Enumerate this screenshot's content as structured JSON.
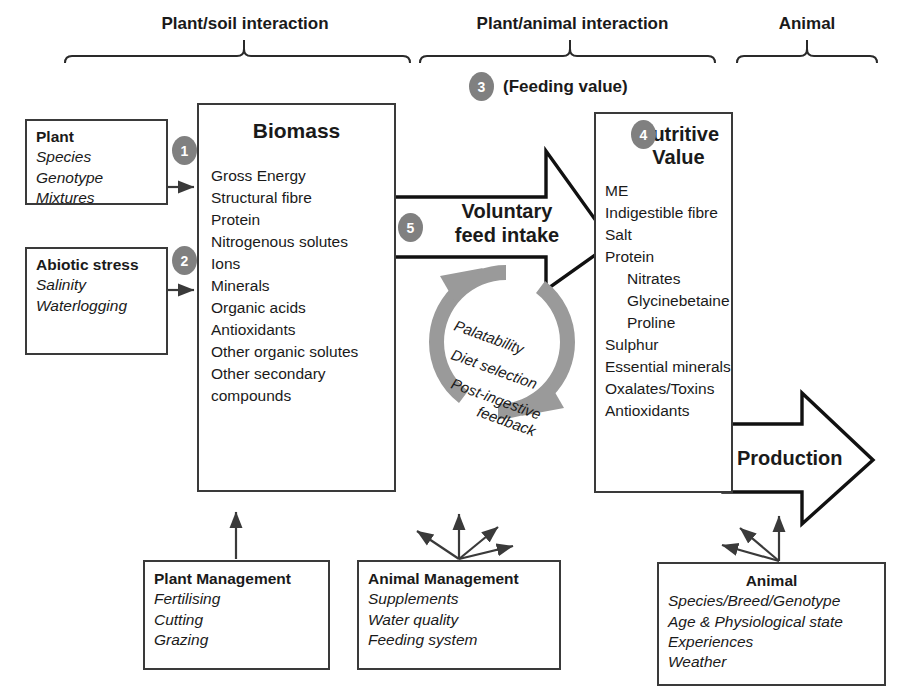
{
  "figure": {
    "headers": [
      {
        "label": "Plant/soil interaction"
      },
      {
        "label": "Plant/animal interaction"
      },
      {
        "label": "Animal"
      }
    ],
    "feeding_value": "(Feeding value)",
    "badges": {
      "one": "1",
      "two": "2",
      "three": "3",
      "four": "4",
      "five": "5"
    },
    "plant_box": {
      "title": "Plant",
      "items": [
        "Species",
        "Genotype",
        "Mixtures"
      ]
    },
    "abiotic_box": {
      "title": "Abiotic stress",
      "items": [
        "Salinity",
        "Waterlogging"
      ]
    },
    "biomass_box": {
      "title": "Biomass",
      "items": [
        "Gross Energy",
        "Structural fibre",
        "Protein",
        "Nitrogenous solutes",
        "Ions",
        "Minerals",
        "Organic acids",
        "Antioxidants",
        "Other organic solutes",
        "Other secondary",
        "compounds"
      ]
    },
    "nutritive_box": {
      "title_line1": "Nutritive",
      "title_line2": "Value",
      "items": [
        {
          "text": "ME",
          "indent": false
        },
        {
          "text": "Indigestible fibre",
          "indent": false
        },
        {
          "text": "Salt",
          "indent": false
        },
        {
          "text": "Protein",
          "indent": false
        },
        {
          "text": "Nitrates",
          "indent": true
        },
        {
          "text": "Glycinebetaine",
          "indent": true
        },
        {
          "text": "Proline",
          "indent": true
        },
        {
          "text": "Sulphur",
          "indent": false
        },
        {
          "text": "Essential minerals",
          "indent": false
        },
        {
          "text": "Oxalates/Toxins",
          "indent": false
        },
        {
          "text": "Antioxidants",
          "indent": false
        }
      ]
    },
    "voluntary_arrow": {
      "line1": "Voluntary",
      "line2": "feed intake"
    },
    "production_arrow": {
      "label": "Production"
    },
    "cycle": {
      "lines": [
        "Palatability",
        "Diet selection",
        "Post-ingestive",
        "feedback"
      ]
    },
    "plant_management_box": {
      "title": "Plant Management",
      "items": [
        "Fertilising",
        "Cutting",
        "Grazing"
      ]
    },
    "animal_management_box": {
      "title": "Animal Management",
      "items": [
        "Supplements",
        "Water quality",
        "Feeding system"
      ]
    },
    "animal_box": {
      "title": "Animal",
      "items": [
        "Species/Breed/Genotype",
        "Age & Physiological state",
        "Experiences",
        "Weather"
      ]
    },
    "colors": {
      "badge_fill": "#808080",
      "cycle_fill": "#9a9a9a",
      "box_stroke": "#3a3a3a",
      "arrow_stroke": "#1a1a1a",
      "background": "#ffffff"
    }
  }
}
